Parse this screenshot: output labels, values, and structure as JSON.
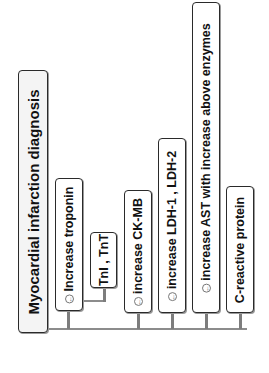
{
  "diagram": {
    "root": {
      "label": "Myocardial infarction diagnosis"
    },
    "children": [
      {
        "label": "Increase troponin",
        "collapse_icon": "←",
        "sub": {
          "label": "TnI , TnT"
        }
      },
      {
        "label": "increase CK-MB",
        "collapse_icon": "←"
      },
      {
        "label": "increase LDH-1 , LDH-2",
        "collapse_icon": "←"
      },
      {
        "label": "increase AST with increase above enzymes",
        "collapse_icon": "←"
      },
      {
        "label": "C-reactive protein"
      }
    ],
    "colors": {
      "border": "#2a2a2a",
      "connector": "#8c8c8c",
      "root_fill": "#f4f4f4"
    }
  }
}
